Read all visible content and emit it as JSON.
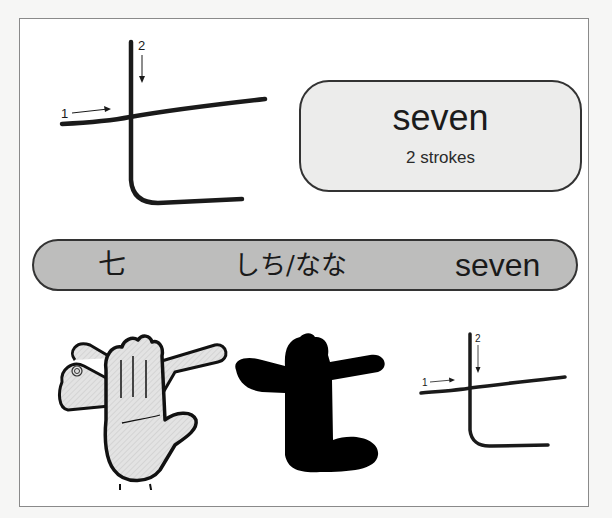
{
  "kanji": {
    "character": "七",
    "meaning": "seven",
    "stroke_count_label": "2 strokes",
    "reading": "しち/なな",
    "english": "seven"
  },
  "stroke_diagram_large": {
    "stroke_labels": [
      "1",
      "2"
    ]
  },
  "stroke_diagram_small": {
    "stroke_labels": [
      "1",
      "2"
    ]
  },
  "illustrations": {
    "hand_gesture": "hands-forming-seven-illustration",
    "silhouette": "black-silhouette-of-seven"
  },
  "colors": {
    "banner_fill": "#bdbdbc",
    "pill_fill": "#ececeb",
    "stroke": "#1a1a1a",
    "frame_border": "#8a8a8a"
  }
}
